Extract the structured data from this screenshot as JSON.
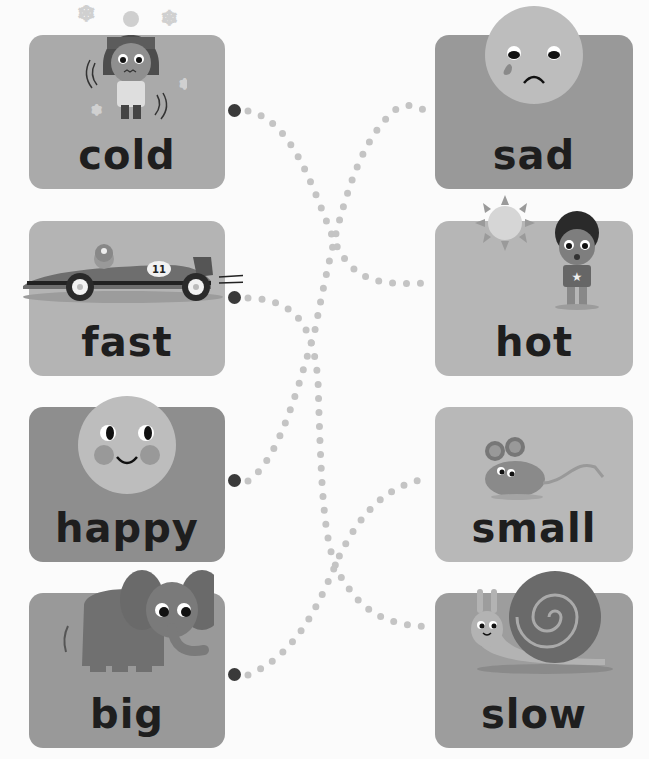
{
  "worksheet": {
    "instruction": "Match each word to its opposite by tracing the dotted lines",
    "left_cards": [
      {
        "word": "cold",
        "picture": "shivering-girl-in-winter-hat-with-snowflakes",
        "tone": "#aaaaaa"
      },
      {
        "word": "fast",
        "picture": "race-car-number-11",
        "car_number": "11",
        "tone": "#b4b4b4"
      },
      {
        "word": "happy",
        "picture": "smiling-face",
        "tone": "#8e8e8e"
      },
      {
        "word": "big",
        "picture": "elephant",
        "tone": "#999999"
      }
    ],
    "right_cards": [
      {
        "word": "sad",
        "picture": "crying-face",
        "tone": "#999999"
      },
      {
        "word": "hot",
        "picture": "sweating-boy-with-sun",
        "tone": "#b6b6b6"
      },
      {
        "word": "small",
        "picture": "mouse",
        "tone": "#b8b8b8"
      },
      {
        "word": "slow",
        "picture": "snail",
        "tone": "#9d9d9d"
      }
    ],
    "matches": [
      {
        "from": "cold",
        "to": "hot"
      },
      {
        "from": "fast",
        "to": "slow"
      },
      {
        "from": "happy",
        "to": "sad"
      },
      {
        "from": "big",
        "to": "small"
      }
    ],
    "colors": {
      "background": "#fbfbfb",
      "dot_trail": "#c4c4c4",
      "start_dot": "#3a3a3a",
      "text": "#1e1e1e"
    }
  }
}
